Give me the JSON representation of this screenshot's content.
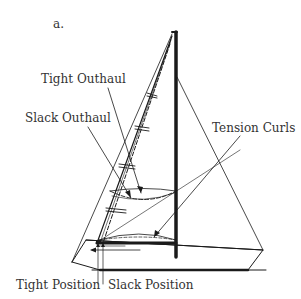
{
  "figure": {
    "panel_label": "a.",
    "labels": {
      "tight_outhaul": "Tight Outhaul",
      "slack_outhaul": "Slack Outhaul",
      "tension_curls": "Tension Curls",
      "tight_position": "Tight Position",
      "slack_position": "Slack Position"
    },
    "colors": {
      "ink": "#1a1a1a",
      "text": "#333333",
      "background": "#ffffff"
    }
  }
}
